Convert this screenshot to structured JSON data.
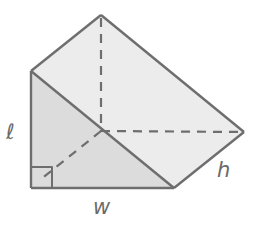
{
  "diagram": {
    "type": "triangular-prism",
    "colors": {
      "line": "#6e6e6e",
      "front_face": "#dcdcdc",
      "slanted_face": "#ececec",
      "background": "#ffffff"
    },
    "labels": {
      "length": "ℓ",
      "width": "w",
      "height": "h"
    },
    "vertices": {
      "front_top": [
        31,
        71
      ],
      "front_bottom_left": [
        31,
        188
      ],
      "front_bottom_right": [
        174,
        188
      ],
      "back_top": [
        101,
        15
      ],
      "back_bottom_left": [
        101,
        131
      ],
      "back_bottom_right": [
        244,
        132
      ]
    },
    "right_angle_marker": {
      "x": 31,
      "y": 167,
      "size": 21
    }
  }
}
